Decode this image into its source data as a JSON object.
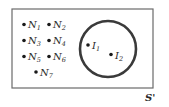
{
  "diagram": {
    "universe_label": "S'",
    "outside_points": [
      {
        "letter": "N",
        "sub": "1"
      },
      {
        "letter": "N",
        "sub": "2"
      },
      {
        "letter": "N",
        "sub": "3"
      },
      {
        "letter": "N",
        "sub": "4"
      },
      {
        "letter": "N",
        "sub": "5"
      },
      {
        "letter": "N",
        "sub": "6"
      },
      {
        "letter": "N",
        "sub": "7"
      }
    ],
    "inside_points": [
      {
        "letter": "I",
        "sub": "1"
      },
      {
        "letter": "I",
        "sub": "2"
      }
    ],
    "colors": {
      "frame": "#6a6a6a",
      "circle": "#3a3a3a",
      "point": "#1a1a1a"
    }
  }
}
